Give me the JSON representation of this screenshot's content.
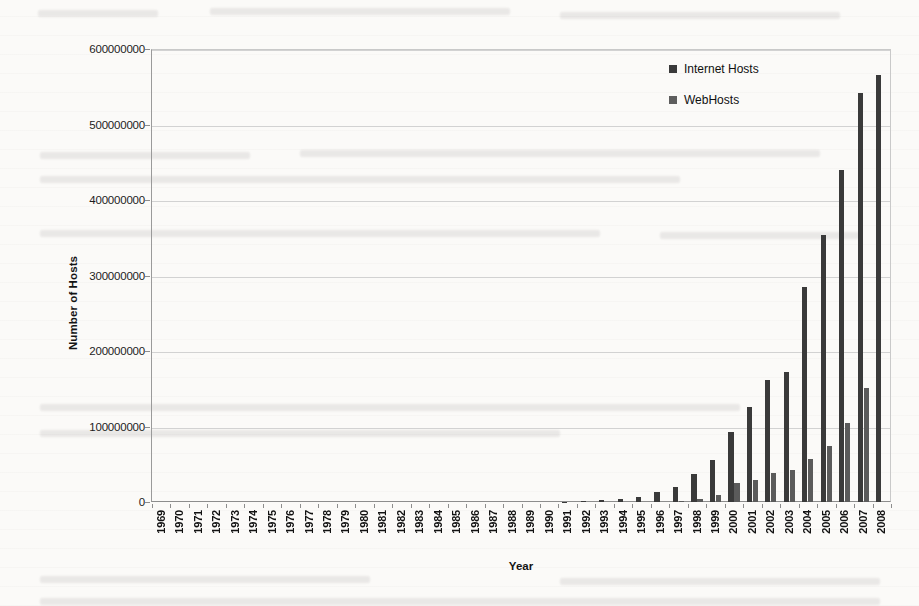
{
  "chart_data": {
    "type": "bar",
    "title": "",
    "xlabel": "Year",
    "ylabel": "Number of Hosts",
    "ylim": [
      0,
      600000000
    ],
    "ytick_labels": [
      "600000000",
      "500000000",
      "400000000",
      "300000000",
      "200000000",
      "100000000",
      "0"
    ],
    "yticks": [
      600000000,
      500000000,
      400000000,
      300000000,
      200000000,
      100000000,
      0
    ],
    "grid": true,
    "legend_position": "inside-top-right",
    "categories": [
      "1969",
      "1970",
      "1971",
      "1972",
      "1973",
      "1974",
      "1975",
      "1976",
      "1977",
      "1978",
      "1979",
      "1980",
      "1981",
      "1982",
      "1983",
      "1984",
      "1985",
      "1986",
      "1987",
      "1988",
      "1989",
      "1990",
      "1991",
      "1992",
      "1993",
      "1994",
      "1995",
      "1996",
      "1997",
      "1998",
      "1999",
      "2000",
      "2001",
      "2002",
      "2003",
      "2004",
      "2005",
      "2006",
      "2007",
      "2008"
    ],
    "series": [
      {
        "name": "Internet Hosts",
        "color": "#3a3a3a",
        "values": [
          0,
          0,
          0,
          0,
          0,
          0,
          0,
          0,
          0,
          0,
          0,
          0,
          0,
          0,
          0,
          1000,
          2000,
          5000,
          28000,
          56000,
          159000,
          313000,
          617000,
          1136000,
          2056000,
          3864000,
          6642000,
          12881000,
          19540000,
          36739000,
          56218000,
          93047000,
          125888000,
          162128000,
          171638000,
          285139000,
          353284000,
          439286000,
          541677000,
          565000000
        ]
      },
      {
        "name": "WebHosts",
        "color": "#5b5b5b",
        "values": [
          0,
          0,
          0,
          0,
          0,
          0,
          0,
          0,
          0,
          0,
          0,
          0,
          0,
          0,
          0,
          0,
          0,
          0,
          0,
          0,
          0,
          0,
          0,
          0,
          130,
          2738,
          23500,
          257601,
          1681868,
          4279000,
          9560866,
          25675581,
          29254370,
          38118962,
          42807275,
          56923737,
          74409971,
          105244649,
          150805762,
          0
        ]
      }
    ]
  },
  "legend": {
    "items": [
      {
        "label": "Internet Hosts"
      },
      {
        "label": "WebHosts"
      }
    ]
  }
}
